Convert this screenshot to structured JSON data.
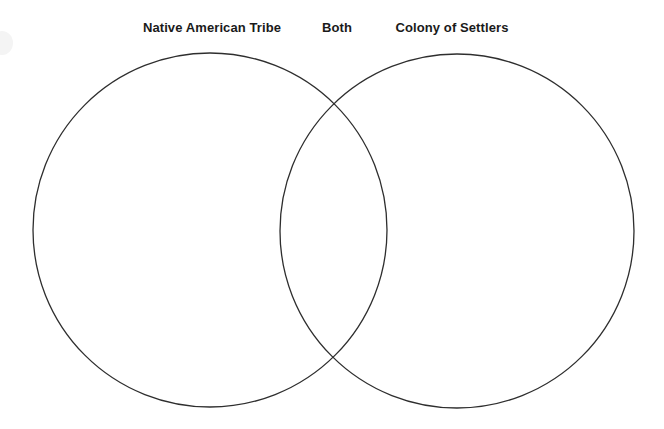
{
  "page": {
    "background_color": "#ffffff"
  },
  "diagram": {
    "type": "venn-2-circle",
    "stroke_color": "#2e2e2e",
    "fill_color": "none",
    "stroke_width": 1.3,
    "labels": {
      "left": "Native American Tribe",
      "middle": "Both",
      "right": "Colony of Settlers"
    },
    "circles": [
      {
        "name": "left-circle",
        "label": "Native American Tribe",
        "cx": 210,
        "cy": 230,
        "r": 177
      },
      {
        "name": "right-circle",
        "label": "Colony of Settlers",
        "cx": 457,
        "cy": 231,
        "r": 177
      }
    ],
    "intersection": {
      "name": "Both",
      "top_point": [
        333,
        72
      ],
      "bottom_point": [
        333,
        385
      ]
    },
    "entries": {
      "left_only": [],
      "both": [],
      "right_only": []
    }
  }
}
